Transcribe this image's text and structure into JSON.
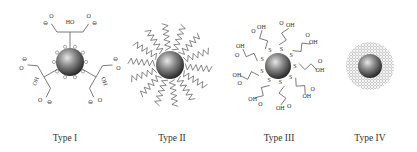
{
  "figure": {
    "panels": [
      {
        "id": "type-1",
        "label": "Type I",
        "ligand": "citrate (carboxylate, hydroxyl)",
        "charge_symbol": "⊖",
        "group_labels": [
          "HO",
          "OH",
          "O"
        ]
      },
      {
        "id": "type-2",
        "label": "Type II",
        "ligand": "wavy polymer chains"
      },
      {
        "id": "type-3",
        "label": "Type III",
        "ligand": "thiol-linked carboxylic acids",
        "atom_labels": {
          "sulfur": "S",
          "acid": "OH",
          "hydroxyl": "HO",
          "oxygen": "O"
        }
      },
      {
        "id": "type-4",
        "label": "Type IV",
        "ligand": "dense dotted shell"
      }
    ]
  }
}
